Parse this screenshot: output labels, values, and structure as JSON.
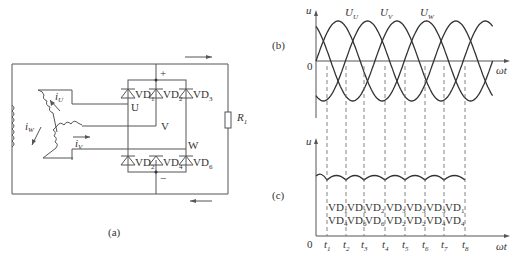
{
  "circuit": {
    "caption": "(a)",
    "plus": "+",
    "minus": "−",
    "nodes": [
      "U",
      "V",
      "W"
    ],
    "resistor": {
      "label": "R",
      "sub": "1"
    },
    "currents": [
      {
        "label": "i",
        "sub": "U"
      },
      {
        "label": "i",
        "sub": "V"
      },
      {
        "label": "i",
        "sub": "W"
      }
    ],
    "diodes_top": [
      {
        "label": "VD",
        "sub": "1"
      },
      {
        "label": "VD",
        "sub": "2"
      },
      {
        "label": "VD",
        "sub": "3"
      }
    ],
    "diodes_bottom": [
      {
        "label": "VD",
        "sub": "2"
      },
      {
        "label": "VD",
        "sub": "4"
      },
      {
        "label": "VD",
        "sub": "6"
      }
    ]
  },
  "chart_data": [
    {
      "type": "line",
      "panel": "(b)",
      "title": "",
      "ylabel": "u",
      "xlabel": "ωt",
      "origin_label": "0",
      "series": [
        {
          "name": "U",
          "sub": "U",
          "phase_deg": 0
        },
        {
          "name": "U",
          "sub": "V",
          "phase_deg": -120
        },
        {
          "name": "U",
          "sub": "W",
          "phase_deg": -240
        }
      ],
      "x_range_deg": [
        0,
        720
      ],
      "y_range": [
        -1.3,
        1.3
      ],
      "grid": false
    },
    {
      "type": "line",
      "panel": "(c)",
      "ylabel": "u",
      "xlabel": "ωt",
      "origin_label": "0",
      "description": "rectified output ripple",
      "ticks": [
        "t1",
        "t2",
        "t3",
        "t4",
        "t5",
        "t6",
        "t7",
        "t8"
      ],
      "conduction_top": [
        "VD1",
        "VD1",
        "VD2",
        "VD3",
        "VD3",
        "VD3",
        "VD1"
      ],
      "conduction_bottom": [
        "VD4",
        "VD6",
        "VD6",
        "VD2",
        "VD2",
        "VD4",
        "VD4"
      ]
    }
  ]
}
